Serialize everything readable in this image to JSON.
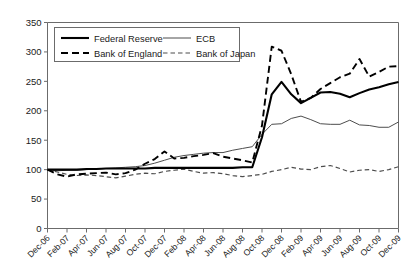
{
  "chart_data": {
    "type": "line",
    "title": "",
    "subtitle": "",
    "xlabel": "",
    "ylabel": "",
    "ylim": [
      0,
      350
    ],
    "ytick_labels": [
      "0",
      "50",
      "100",
      "150",
      "200",
      "250",
      "300",
      "350"
    ],
    "ytick_values": [
      0,
      50,
      100,
      150,
      200,
      250,
      300,
      350
    ],
    "grid": false,
    "legend_position": "top-left",
    "x": [
      "Dec-06",
      "Jan-07",
      "Feb-07",
      "Mar-07",
      "Apr-07",
      "May-07",
      "Jun-07",
      "Jul-07",
      "Aug-07",
      "Sep-07",
      "Oct-07",
      "Nov-07",
      "Dec-07",
      "Jan-08",
      "Feb-08",
      "Mar-08",
      "Apr-08",
      "May-08",
      "Jun-08",
      "Jul-08",
      "Aug-08",
      "Sep-08",
      "Oct-08",
      "Nov-08",
      "Dec-08",
      "Jan-09",
      "Feb-09",
      "Mar-09",
      "Apr-09",
      "May-09",
      "Jun-09",
      "Jul-09",
      "Aug-09",
      "Sep-09",
      "Oct-09",
      "Nov-09",
      "Dec-09"
    ],
    "xtick_labels": [
      "Dec-06",
      "Feb-07",
      "Apr-07",
      "Jun-07",
      "Aug-07",
      "Oct-07",
      "Dec-07",
      "Feb-08",
      "Apr-08",
      "Jun-08",
      "Aug-08",
      "Oct-08",
      "Dec-08",
      "Feb-09",
      "Apr-09",
      "Jun-09",
      "Aug-09",
      "Oct-09",
      "Dec-09"
    ],
    "xtick_indices": [
      0,
      2,
      4,
      6,
      8,
      10,
      12,
      14,
      16,
      18,
      20,
      22,
      24,
      26,
      28,
      30,
      32,
      34,
      36
    ],
    "series": [
      {
        "name": "Federal Reserve",
        "style": "solid-thick",
        "color": "#000000",
        "values": [
          100,
          100,
          100,
          100,
          101,
          101,
          102,
          102,
          102,
          102,
          102,
          103,
          103,
          103,
          103,
          103,
          103,
          103,
          103,
          103,
          104,
          104,
          155,
          228,
          249,
          228,
          213,
          222,
          231,
          232,
          229,
          223,
          230,
          236,
          240,
          245,
          249
        ]
      },
      {
        "name": "ECB",
        "style": "solid-thin",
        "color": "#4d4d4d",
        "values": [
          100,
          98,
          99,
          99,
          100,
          101,
          102,
          103,
          104,
          105,
          107,
          111,
          116,
          121,
          124,
          126,
          128,
          129,
          129,
          133,
          136,
          139,
          160,
          177,
          178,
          187,
          191,
          185,
          178,
          177,
          177,
          184,
          176,
          175,
          172,
          172,
          181
        ]
      },
      {
        "name": "Bank of England",
        "style": "dashed-long",
        "color": "#000000",
        "values": [
          100,
          92,
          88,
          92,
          93,
          94,
          95,
          92,
          94,
          100,
          110,
          118,
          131,
          119,
          120,
          123,
          125,
          128,
          122,
          119,
          116,
          112,
          175,
          309,
          302,
          262,
          215,
          222,
          237,
          247,
          257,
          263,
          288,
          258,
          266,
          275,
          276
        ]
      },
      {
        "name": "Bank of Japan",
        "style": "dashed-short",
        "color": "#4d4d4d",
        "values": [
          100,
          96,
          92,
          90,
          91,
          90,
          88,
          86,
          89,
          92,
          94,
          93,
          97,
          99,
          101,
          97,
          94,
          95,
          93,
          90,
          88,
          90,
          92,
          97,
          100,
          104,
          101,
          100,
          105,
          107,
          102,
          96,
          99,
          100,
          97,
          100,
          105
        ]
      }
    ]
  },
  "legend": {
    "entries": [
      {
        "label": "Federal Reserve"
      },
      {
        "label": "ECB"
      },
      {
        "label": "Bank of England"
      },
      {
        "label": "Bank of Japan"
      }
    ]
  }
}
